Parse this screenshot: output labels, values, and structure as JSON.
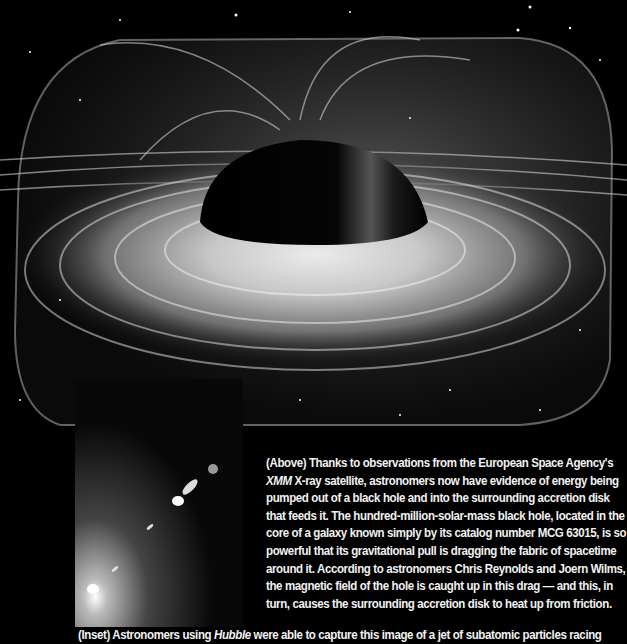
{
  "hero_image": {
    "alt": "Artist's illustration of a black hole surrounded by a swirling accretion disk with magnetic field lines against a starfield"
  },
  "inset_image": {
    "alt": "Hubble image of a jet of subatomic particles streaming from a bright galactic core"
  },
  "caption": {
    "part1": "(Above) Thanks to observations from the European Space Agency's ",
    "italic": "XMM",
    "part2": " X-ray satellite, astronomers now have evidence of energy being pumped out of a black hole and into the surrounding accretion disk that feeds it. The hundred-million-solar-mass black hole, located in the core of a galaxy known simply by its catalog number MCG 63015, is so powerful that its gravitational pull is dragging the fabric of spacetime around it. According to astronomers Chris Reynolds and Joern Wilms, the magnetic field of the hole is caught up in this drag — and this, in turn, causes the surrounding accretion disk to heat up from friction."
  },
  "bottom_caption": {
    "part1": "(Inset) Astronomers using ",
    "italic": "Hubble",
    "part2": " were able to capture this image of a jet of subatomic particles racing"
  }
}
